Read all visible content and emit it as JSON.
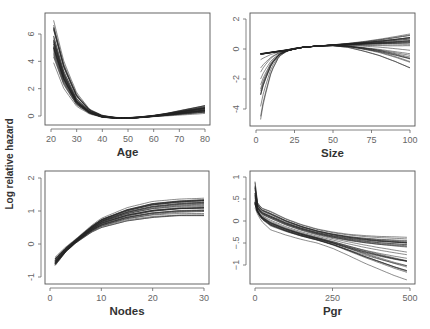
{
  "figure": {
    "ylabel": "Log relative hazard"
  },
  "chart_data": [
    {
      "type": "line",
      "panel": "top-left",
      "title": "",
      "xlabel": "Age",
      "ylabel": "Log relative hazard",
      "xlim": [
        20,
        80
      ],
      "ylim": [
        -0.5,
        7.3
      ],
      "xticks": [
        20,
        30,
        40,
        50,
        60,
        70,
        80
      ],
      "xtick_labels": [
        "20",
        "30",
        "40",
        "50",
        "60",
        "70",
        "80"
      ],
      "yticks": [
        0,
        2,
        4,
        6
      ],
      "ytick_labels": [
        "0",
        "2",
        "4",
        "6"
      ],
      "n_curves": 30,
      "description": "Bootstrap spline curves: steep decline from ~4-7 at age 21 to ~0 at age 40-45, minimum ~-0.15 near 50, rising slowly to ~0.2-0.8 at 80",
      "x": [
        21,
        25,
        30,
        35,
        40,
        45,
        50,
        55,
        60,
        65,
        70,
        75,
        80
      ],
      "series": [
        {
          "name": "upper",
          "values": [
            7.0,
            4.0,
            1.7,
            0.5,
            0.05,
            -0.1,
            -0.12,
            -0.05,
            0.05,
            0.2,
            0.4,
            0.6,
            0.8
          ]
        },
        {
          "name": "median",
          "values": [
            5.5,
            3.0,
            1.1,
            0.3,
            -0.05,
            -0.13,
            -0.15,
            -0.1,
            0.0,
            0.12,
            0.25,
            0.38,
            0.5
          ]
        },
        {
          "name": "lower",
          "values": [
            3.9,
            2.0,
            0.7,
            0.15,
            -0.1,
            -0.18,
            -0.18,
            -0.12,
            -0.05,
            0.0,
            0.05,
            0.1,
            0.15
          ]
        }
      ],
      "grid": false
    },
    {
      "type": "line",
      "panel": "top-right",
      "title": "",
      "xlabel": "Size",
      "ylabel": "",
      "xlim": [
        0,
        100
      ],
      "ylim": [
        -5,
        2.5
      ],
      "xticks": [
        0,
        25,
        50,
        75,
        100
      ],
      "xtick_labels": [
        "0",
        "25",
        "50",
        "75",
        "100"
      ],
      "yticks": [
        -4,
        -2,
        0,
        2
      ],
      "ytick_labels": [
        "-4",
        "-2",
        "0",
        "2"
      ],
      "n_curves": 30,
      "description": "Most curves nearly linear from ~-0.35 at size 3 to ~0.3 at 100; some curves plunge to -2 to -4.7 near size 3-5; a few bend down to -0.6 and -1.3 at 100",
      "x": [
        3,
        5,
        10,
        15,
        20,
        25,
        30,
        40,
        50,
        60,
        70,
        80,
        90,
        100
      ],
      "series": [
        {
          "name": "upper",
          "values": [
            -0.3,
            -0.28,
            -0.2,
            -0.12,
            -0.05,
            0.05,
            0.12,
            0.2,
            0.28,
            0.38,
            0.5,
            0.65,
            0.82,
            1.0
          ]
        },
        {
          "name": "median",
          "values": [
            -0.35,
            -0.33,
            -0.25,
            -0.18,
            -0.1,
            0.0,
            0.1,
            0.2,
            0.25,
            0.28,
            0.3,
            0.32,
            0.33,
            0.35
          ]
        },
        {
          "name": "lower",
          "values": [
            -4.7,
            -3.5,
            -1.5,
            -0.5,
            -0.15,
            0.0,
            0.1,
            0.2,
            0.22,
            0.1,
            -0.15,
            -0.45,
            -0.85,
            -1.3
          ]
        }
      ],
      "grid": false
    },
    {
      "type": "line",
      "panel": "bottom-left",
      "title": "",
      "xlabel": "Nodes",
      "ylabel": "Log relative hazard",
      "xlim": [
        0,
        30
      ],
      "ylim": [
        -1.1,
        2.2
      ],
      "xticks": [
        0,
        10,
        20,
        30
      ],
      "xtick_labels": [
        "0",
        "10",
        "20",
        "30"
      ],
      "yticks": [
        -1,
        0,
        1,
        2
      ],
      "ytick_labels": [
        "-1",
        "0",
        "1",
        "2"
      ],
      "n_curves": 30,
      "description": "Curves rise from ~-0.6 at 1 node through 0 near 4-5, flatten toward 0.85-1.4 at 30",
      "x": [
        1,
        3,
        5,
        8,
        10,
        15,
        20,
        25,
        30
      ],
      "series": [
        {
          "name": "upper",
          "values": [
            -0.4,
            -0.1,
            0.15,
            0.55,
            0.78,
            1.1,
            1.3,
            1.38,
            1.42
          ]
        },
        {
          "name": "median",
          "values": [
            -0.55,
            -0.2,
            0.08,
            0.45,
            0.65,
            0.9,
            1.05,
            1.12,
            1.15
          ]
        },
        {
          "name": "lower",
          "values": [
            -0.65,
            -0.25,
            0.03,
            0.35,
            0.5,
            0.7,
            0.8,
            0.85,
            0.85
          ]
        }
      ],
      "grid": false
    },
    {
      "type": "line",
      "panel": "bottom-right",
      "title": "",
      "xlabel": "Pgr",
      "ylabel": "",
      "xlim": [
        0,
        500
      ],
      "ylim": [
        -1.45,
        1.1
      ],
      "xticks": [
        0,
        250,
        500
      ],
      "xtick_labels": [
        "0",
        "250",
        "500"
      ],
      "yticks": [
        -1,
        -0.5,
        0,
        0.5,
        1
      ],
      "ytick_labels": [
        "−1",
        "−.5",
        "0",
        ".5",
        "1"
      ],
      "n_curves": 30,
      "description": "Sharp spike to ~0.9 near Pgr 0, rapid drop to 0.1-0.35 by Pgr 20, then gradual decline to -0.35 to -1.35 at Pgr 490",
      "x": [
        0,
        5,
        20,
        50,
        100,
        150,
        200,
        250,
        300,
        350,
        400,
        450,
        490
      ],
      "series": [
        {
          "name": "upper",
          "values": [
            0.9,
            0.45,
            0.3,
            0.22,
            0.05,
            -0.08,
            -0.18,
            -0.25,
            -0.3,
            -0.33,
            -0.35,
            -0.36,
            -0.37
          ]
        },
        {
          "name": "median",
          "values": [
            0.5,
            0.3,
            0.15,
            0.05,
            -0.1,
            -0.22,
            -0.32,
            -0.4,
            -0.47,
            -0.53,
            -0.58,
            -0.62,
            -0.65
          ]
        },
        {
          "name": "lower",
          "values": [
            0.3,
            0.2,
            0.0,
            -0.2,
            -0.32,
            -0.42,
            -0.5,
            -0.62,
            -0.78,
            -0.95,
            -1.1,
            -1.25,
            -1.35
          ]
        }
      ],
      "grid": false
    }
  ]
}
